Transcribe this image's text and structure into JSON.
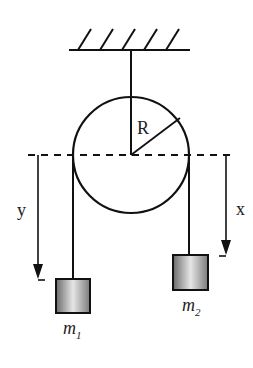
{
  "diagram": {
    "type": "pulley-atwood-machine",
    "labels": {
      "radius": "R",
      "left_displacement": "y",
      "right_displacement": "x",
      "mass_left": "m",
      "mass_left_sub": "1",
      "mass_right": "m",
      "mass_right_sub": "2"
    },
    "colors": {
      "stroke": "#111111",
      "label": "#222222"
    }
  }
}
